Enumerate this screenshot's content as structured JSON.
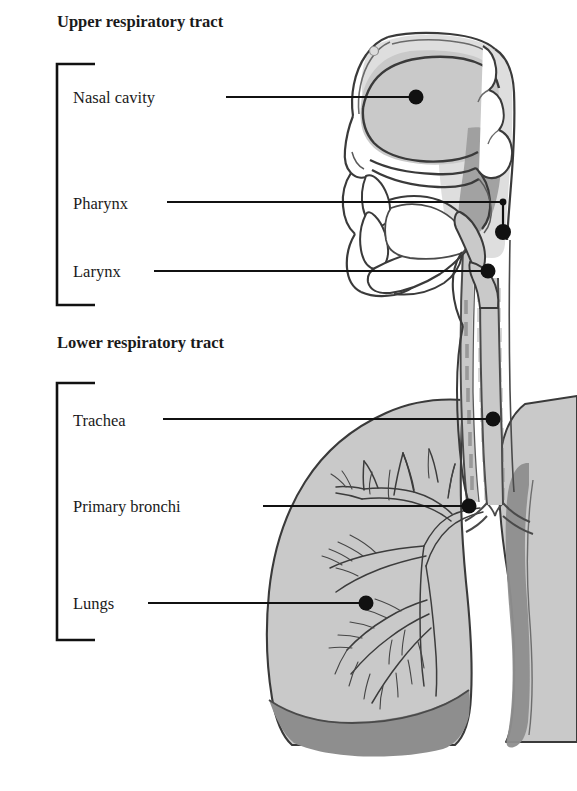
{
  "figure": {
    "type": "labeled-anatomical-diagram",
    "background_color": "#ffffff",
    "line_color": "#111111",
    "outline_color": "#3a3a3a",
    "fill_light_gray": "#c9c9c9",
    "fill_mid_gray": "#b4b4b4",
    "fill_dark_gray": "#8e8e8e",
    "fill_pale_gray": "#dedede",
    "fill_white": "#ffffff"
  },
  "sections": [
    {
      "id": "upper",
      "heading": "Upper respiratory tract",
      "heading_x": 57,
      "heading_y": 27,
      "bracket": {
        "x": 57,
        "top": 64,
        "bottom": 305,
        "arm": 38
      },
      "labels": [
        {
          "name": "nasal-cavity",
          "text": "Nasal cavity",
          "text_x": 73,
          "text_y": 103,
          "leader": {
            "x1": 226,
            "y1": 97,
            "x2": 413,
            "y2": 97
          },
          "dot": {
            "cx": 416,
            "cy": 97,
            "r": 7.5
          }
        },
        {
          "name": "pharynx",
          "text": "Pharynx",
          "text_x": 73,
          "text_y": 209,
          "leader": {
            "x1": 167,
            "y1": 202,
            "x2": 502,
            "y2": 202
          },
          "dot": {
            "cx": 503,
            "cy": 232,
            "r": 8.0
          },
          "elbow": {
            "x": 503,
            "y1": 202,
            "y2": 228
          },
          "small_dot": {
            "cx": 503,
            "cy": 202,
            "r": 3.4
          }
        },
        {
          "name": "larynx",
          "text": "Larynx",
          "text_x": 73,
          "text_y": 277,
          "leader": {
            "x1": 154,
            "y1": 271,
            "x2": 485,
            "y2": 271
          },
          "dot": {
            "cx": 488,
            "cy": 271,
            "r": 7.5
          }
        }
      ]
    },
    {
      "id": "lower",
      "heading": "Lower respiratory tract",
      "heading_x": 57,
      "heading_y": 348,
      "bracket": {
        "x": 57,
        "top": 383,
        "bottom": 640,
        "arm": 38
      },
      "labels": [
        {
          "name": "trachea",
          "text": "Trachea",
          "text_x": 73,
          "text_y": 426,
          "leader": {
            "x1": 163,
            "y1": 419,
            "x2": 490,
            "y2": 419
          },
          "dot": {
            "cx": 493,
            "cy": 419,
            "r": 7.5
          }
        },
        {
          "name": "primary-bronchi",
          "text": "Primary bronchi",
          "text_x": 73,
          "text_y": 512,
          "leader": {
            "x1": 263,
            "y1": 506,
            "x2": 466,
            "y2": 506
          },
          "dot": {
            "cx": 469,
            "cy": 506,
            "r": 7.5
          }
        },
        {
          "name": "lungs",
          "text": "Lungs",
          "text_x": 73,
          "text_y": 609,
          "leader": {
            "x1": 148,
            "y1": 603,
            "x2": 363,
            "y2": 603
          },
          "dot": {
            "cx": 366,
            "cy": 603,
            "r": 7.5
          }
        }
      ]
    }
  ],
  "anatomy_parts": [
    "head-sagittal-section",
    "nasal-cavity",
    "nasal-septum",
    "hard-palate",
    "soft-palate",
    "uvula",
    "tongue",
    "teeth",
    "oral-cavity",
    "pharynx",
    "epiglottis",
    "larynx",
    "trachea",
    "esophagus",
    "left-lung",
    "right-lung",
    "primary-bronchi",
    "bronchial-tree",
    "diaphragm"
  ]
}
